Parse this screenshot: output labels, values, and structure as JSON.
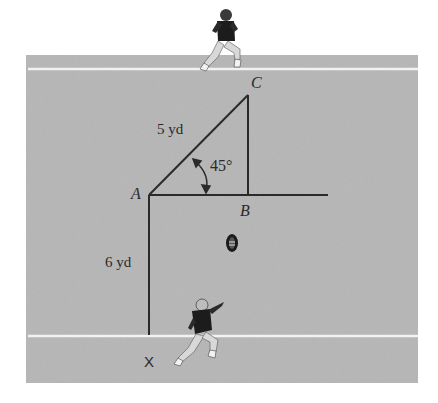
{
  "figure": {
    "colors": {
      "background": "#ffffff",
      "field": "#b3b3b3",
      "yard_line": "#f2f2f2",
      "path_line": "#2a2a2a",
      "label": "#2a2a2a"
    },
    "points": {
      "A": "A",
      "B": "B",
      "C": "C",
      "X": "X"
    },
    "labels": {
      "ac_length": "5 yd",
      "xa_length": "6 yd",
      "angle": "45°"
    },
    "icons": {
      "receiver": "football-player-running-icon",
      "quarterback": "football-player-throwing-icon",
      "ball": "football-icon"
    }
  }
}
